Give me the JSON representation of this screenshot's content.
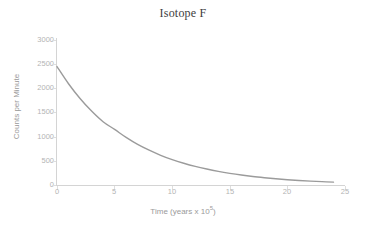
{
  "chart_data": {
    "type": "line",
    "title": "Isotope F",
    "xlabel_prefix": "Time (years x 10",
    "xlabel_exponent": "5",
    "xlabel_suffix": ")",
    "xlabel": "Time (years x 10⁵)",
    "ylabel": "Counts per Minute",
    "xlim": [
      0,
      25
    ],
    "ylim": [
      0,
      3000
    ],
    "xticks": [
      "0",
      "5",
      "10",
      "15",
      "20",
      "25"
    ],
    "yticks": [
      "0",
      "500",
      "1000",
      "1500",
      "2000",
      "2500",
      "3000"
    ],
    "grid": false,
    "legend": "none",
    "series": [
      {
        "name": "Isotope F decay",
        "color": "#9b9b9b",
        "x": [
          0,
          1,
          2,
          3,
          4,
          5,
          6,
          7,
          8,
          9,
          10,
          11,
          12,
          13,
          14,
          15,
          16,
          17,
          18,
          19,
          20,
          21,
          22,
          23,
          24
        ],
        "values": [
          2450,
          2095,
          1790,
          1530,
          1310,
          1150,
          985,
          840,
          720,
          615,
          525,
          450,
          385,
          330,
          282,
          241,
          206,
          176,
          151,
          129,
          110,
          94,
          80,
          69,
          59
        ]
      }
    ],
    "annotations": []
  },
  "chart": {
    "title": "Isotope F",
    "x_axis": {
      "title_prefix": "Time (years x 10",
      "title_exponent": "5",
      "title_suffix": ")",
      "ticks": [
        "0",
        "5",
        "10",
        "15",
        "20",
        "25"
      ]
    },
    "y_axis": {
      "title": "Counts per Minute",
      "ticks": [
        "3000",
        "2500",
        "2000",
        "1500",
        "1000",
        "500",
        "0"
      ]
    }
  },
  "colors": {
    "curve": "#9b9b9b",
    "axis": "#d4d4d4",
    "tick_text": "#b4b4b4",
    "axis_title_text": "#9a9a9a",
    "title_text": "#3d3d3d",
    "background": "#ffffff"
  }
}
